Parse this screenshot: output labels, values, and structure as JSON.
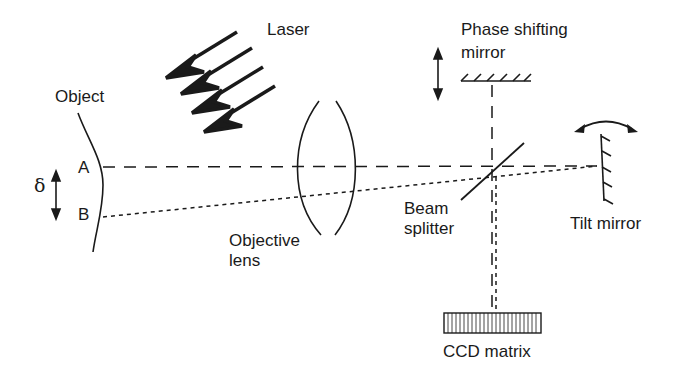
{
  "diagram": {
    "labels": {
      "laser": "Laser",
      "object": "Object",
      "point_a": "A",
      "point_b": "B",
      "delta": "δ",
      "objective_lens_line1": "Objective",
      "objective_lens_line2": "lens",
      "phase_mirror_line1": "Phase shifting",
      "phase_mirror_line2": "mirror",
      "beam_splitter_line1": "Beam",
      "beam_splitter_line2": "splitter",
      "tilt_mirror": "Tilt mirror",
      "ccd": "CCD matrix"
    },
    "colors": {
      "ink": "#1a1a1a",
      "background": "#ffffff"
    }
  }
}
